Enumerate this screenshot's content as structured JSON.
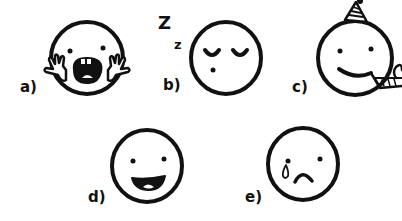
{
  "figure": {
    "ink_color": "#111111",
    "background": "#ffffff",
    "items": [
      {
        "id": "a",
        "label": "a)",
        "emotion": "scared / screaming",
        "features": [
          "dot eyes",
          "open screaming mouth with teeth",
          "hands on cheeks"
        ]
      },
      {
        "id": "b",
        "label": "b)",
        "emotion": "sleepy / sleeping",
        "features": [
          "closed eyes",
          "small dot mouth",
          "Z z sleep letters"
        ],
        "sleep_letters": [
          "Z",
          "z"
        ]
      },
      {
        "id": "c",
        "label": "c)",
        "emotion": "celebrating / party",
        "features": [
          "dot eyes",
          "smile",
          "party hat",
          "party horn blower"
        ]
      },
      {
        "id": "d",
        "label": "d)",
        "emotion": "happy",
        "features": [
          "dot eyes",
          "open smiling mouth"
        ]
      },
      {
        "id": "e",
        "label": "e)",
        "emotion": "sad / crying",
        "features": [
          "dot eyes",
          "tear drop",
          "frown"
        ]
      }
    ]
  }
}
